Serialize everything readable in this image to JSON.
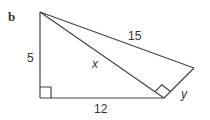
{
  "figure": {
    "part_label": "b",
    "labels": {
      "left_side": "5",
      "bottom_side": "12",
      "hypotenuse_outer": "15",
      "diagonal": "x",
      "short_side": "y"
    },
    "colors": {
      "stroke": "#444444",
      "text": "#333333",
      "background": "#ffffff"
    }
  }
}
